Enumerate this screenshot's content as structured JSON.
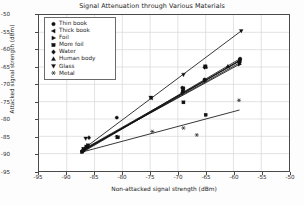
{
  "chart_data": {
    "type": "scatter",
    "title": "Signal Attenuation through Various Materials",
    "xlabel": "Non-attacked signal strength (dBm)",
    "ylabel": "Attacked signal strength (dBm)",
    "xlim": [
      -95,
      -50
    ],
    "ylim": [
      -95,
      -50
    ],
    "xticks": [
      -95,
      -90,
      -85,
      -80,
      -75,
      -70,
      -65,
      -60,
      -55,
      -50
    ],
    "yticks": [
      -95,
      -90,
      -85,
      -80,
      -75,
      -70,
      -65,
      -60,
      -55,
      -50
    ],
    "grid": true,
    "legend_position": "upper left",
    "series": [
      {
        "name": "Thin book",
        "marker": "circle",
        "color": "#111111",
        "points": [
          [
            -87.2,
            -89.3
          ],
          [
            -86.6,
            -88.4
          ],
          [
            -81.0,
            -79.6
          ],
          [
            -69.2,
            -71.0
          ],
          [
            -65.2,
            -68.6
          ],
          [
            -58.8,
            -62.6
          ]
        ],
        "fit_line": [
          [
            -87.4,
            -89.6
          ],
          [
            -58.8,
            -62.6
          ]
        ]
      },
      {
        "name": "Thick book",
        "marker": "triangle-left",
        "color": "#111111",
        "points": [
          [
            -87.1,
            -89.0
          ],
          [
            -86.4,
            -87.8
          ],
          [
            -74.8,
            -74.0
          ],
          [
            -69.0,
            -71.2
          ],
          [
            -65.0,
            -65.0
          ],
          [
            -59.0,
            -63.4
          ]
        ],
        "fit_line": [
          [
            -87.4,
            -89.4
          ],
          [
            -59.0,
            -63.4
          ]
        ]
      },
      {
        "name": "Foil",
        "marker": "triangle-right",
        "color": "#111111",
        "points": [
          [
            -87.0,
            -88.8
          ],
          [
            -86.5,
            -88.0
          ],
          [
            -80.9,
            -85.2
          ],
          [
            -69.1,
            -72.0
          ],
          [
            -65.1,
            -69.0
          ],
          [
            -58.9,
            -64.2
          ]
        ],
        "fit_line": [
          [
            -87.4,
            -89.2
          ],
          [
            -58.9,
            -64.2
          ]
        ]
      },
      {
        "name": "More foil",
        "marker": "square",
        "color": "#111111",
        "points": [
          [
            -87.3,
            -89.5
          ],
          [
            -86.2,
            -87.6
          ],
          [
            -80.8,
            -85.3
          ],
          [
            -69.0,
            -75.2
          ],
          [
            -65.0,
            -78.8
          ],
          [
            -58.8,
            -63.0
          ]
        ],
        "fit_line": [
          [
            -87.4,
            -89.8
          ],
          [
            -58.8,
            -63.0
          ]
        ]
      },
      {
        "name": "Water",
        "marker": "diamond",
        "color": "#111111",
        "points": [
          [
            -87.0,
            -89.1
          ],
          [
            -86.3,
            -87.9
          ],
          [
            -86.0,
            -85.4
          ],
          [
            -69.2,
            -72.4
          ],
          [
            -65.2,
            -65.1
          ],
          [
            -58.9,
            -63.8
          ]
        ],
        "fit_line": [
          [
            -87.3,
            -89.3
          ],
          [
            -58.9,
            -63.8
          ]
        ]
      },
      {
        "name": "Human body",
        "marker": "triangle-up",
        "color": "#111111",
        "points": [
          [
            -87.1,
            -88.9
          ],
          [
            -86.4,
            -88.2
          ],
          [
            -69.1,
            -71.6
          ],
          [
            -65.0,
            -64.9
          ],
          [
            -61.0,
            -64.8
          ],
          [
            -58.9,
            -63.2
          ]
        ],
        "fit_line": [
          [
            -87.4,
            -89.1
          ],
          [
            -58.9,
            -63.2
          ]
        ]
      },
      {
        "name": "Glass",
        "marker": "triangle-down",
        "color": "#111111",
        "points": [
          [
            -87.0,
            -88.6
          ],
          [
            -86.6,
            -85.6
          ],
          [
            -74.9,
            -73.8
          ],
          [
            -69.0,
            -67.2
          ],
          [
            -65.1,
            -64.8
          ],
          [
            -58.6,
            -54.6
          ]
        ],
        "fit_line": [
          [
            -87.3,
            -89.0
          ],
          [
            -58.6,
            -54.6
          ]
        ]
      },
      {
        "name": "Metal",
        "marker": "asterisk",
        "color": "#111111",
        "points": [
          [
            -87.2,
            -89.4
          ],
          [
            -81.0,
            -85.1
          ],
          [
            -74.6,
            -83.6
          ],
          [
            -69.0,
            -82.6
          ],
          [
            -66.6,
            -84.6
          ],
          [
            -59.0,
            -74.6
          ]
        ],
        "fit_line": [
          [
            -87.4,
            -89.6
          ],
          [
            -58.9,
            -77.4
          ]
        ]
      }
    ]
  }
}
